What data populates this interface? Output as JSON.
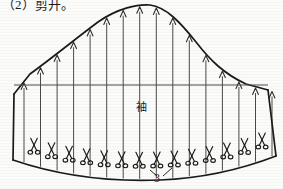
{
  "caption": {
    "text": "（2）剪开。"
  },
  "figure": {
    "type": "garment-pattern-diagram",
    "title_label": "袖",
    "number_label": "3",
    "colors": {
      "outline": "#1a1a1a",
      "slash_line": "#4a4a4a",
      "background": "#fbfbfa",
      "text": "#1d1d1d"
    },
    "outline": {
      "cap_curve": "M 14,94 L 30,74 C 52,58 74,40 98,22 C 118,8 138,4 150,5 C 166,7 180,22 196,42 C 210,60 224,74 246,84 L 268,90",
      "left_side": "M 14,94 L 13,160",
      "right_side": "M 268,90 L 276,156",
      "hem_curve": "M 13,160 C 60,176 110,182 160,180 C 210,178 250,166 276,156",
      "biceps_line": {
        "x1": 14,
        "y1": 85,
        "x2": 268,
        "y2": 85
      }
    },
    "slash_lines_count": 16,
    "scissors_count": 14,
    "arrow_direction": "up",
    "leader_lines": [
      {
        "x1": 150,
        "y1": 170,
        "x2": 157,
        "y2": 176
      },
      {
        "x1": 172,
        "y1": 168,
        "x2": 163,
        "y2": 176
      }
    ]
  }
}
